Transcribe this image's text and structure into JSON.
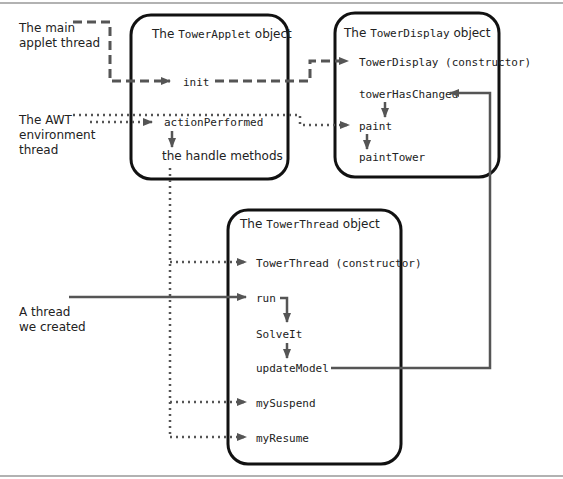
{
  "colors": {
    "line": "#555555",
    "box": "#111111",
    "rule": "#999999"
  },
  "threads": {
    "main": [
      "The main",
      "applet thread"
    ],
    "awt": [
      "The AWT",
      "environment",
      "thread"
    ],
    "created": [
      "A thread",
      "we created"
    ]
  },
  "boxes": {
    "applet": {
      "title_pre": "The ",
      "title_class": "TowerApplet",
      "title_post": " object",
      "methods": {
        "init": "init",
        "actionPerformed": "actionPerformed",
        "handle": "the handle methods"
      }
    },
    "display": {
      "title_pre": "The ",
      "title_class": "TowerDisplay",
      "title_post": " object",
      "methods": {
        "constructor": "TowerDisplay (constructor)",
        "towerHasChanged": "towerHasChanged",
        "paint": "paint",
        "paintTower": "paintTower"
      }
    },
    "thread": {
      "title_pre": "The ",
      "title_class": "TowerThread",
      "title_post": " object",
      "methods": {
        "constructor": "TowerThread (constructor)",
        "run": "run",
        "solveIt": "SolveIt",
        "updateModel": "updateModel",
        "mySuspend": "mySuspend",
        "myResume": "myResume"
      }
    }
  },
  "legend": {
    "dashed": "main applet thread",
    "dotted": "AWT environment thread",
    "solid": "thread we created"
  }
}
